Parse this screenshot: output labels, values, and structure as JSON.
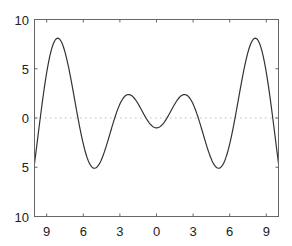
{
  "chart_data": {
    "type": "line",
    "title": "",
    "xlabel": "",
    "ylabel": "",
    "function": "y = x*sin(x) - cos(x)",
    "xlim": [
      -10,
      10
    ],
    "ylim": [
      -10,
      10
    ],
    "grid": false,
    "legend": null,
    "x_ticks": [
      -9,
      -6,
      -3,
      0,
      3,
      6,
      9
    ],
    "x_tick_labels": [
      "9",
      "6",
      "3",
      "0",
      "3",
      "6",
      "9"
    ],
    "y_ticks": [
      10,
      5,
      0,
      -5,
      -10
    ],
    "y_tick_labels": [
      "10",
      "5",
      "0",
      "5",
      "10"
    ],
    "reference_line": {
      "y": 0,
      "style": "dotted",
      "color": "#bbbbbb"
    },
    "series": [
      {
        "name": "curve",
        "color": "#333333",
        "x": [
          -10,
          -9,
          -8,
          -7,
          -6,
          -5,
          -4,
          -3,
          -2.3,
          -2,
          -1,
          0,
          1,
          2,
          2.3,
          3,
          4,
          5,
          6,
          7,
          8,
          9,
          10
        ],
        "y": [
          -4.6,
          4.6,
          8.1,
          3.8,
          -0.7,
          -5.1,
          -2.4,
          1.4,
          2.4,
          2.2,
          0.3,
          -1.0,
          0.3,
          2.2,
          2.4,
          1.4,
          -2.4,
          -5.1,
          -0.7,
          3.8,
          8.1,
          4.6,
          -4.6
        ]
      }
    ]
  }
}
